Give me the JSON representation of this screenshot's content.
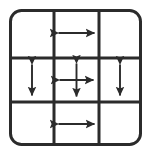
{
  "figure": {
    "type": "diagram",
    "background_color": "#ffffff",
    "stroke_color": "#2b2b2b",
    "outer_border": {
      "x": 9,
      "y": 9,
      "width": 133,
      "height": 137,
      "corner_radius": 11,
      "stroke_width": 3
    },
    "grid": {
      "rows": 3,
      "columns": 3,
      "vertical_lines_x": [
        54,
        99
      ],
      "horizontal_lines_y": [
        58,
        102
      ],
      "stroke_width": 3
    },
    "cells": [
      {
        "id": "cell-top-left",
        "row": 0,
        "column": 0,
        "arrow": "none",
        "label": ""
      },
      {
        "id": "cell-top-center",
        "row": 0,
        "column": 1,
        "arrow": "horizontal-double-arrow",
        "label": ""
      },
      {
        "id": "cell-top-right",
        "row": 0,
        "column": 2,
        "arrow": "none",
        "label": ""
      },
      {
        "id": "cell-middle-left",
        "row": 1,
        "column": 0,
        "arrow": "vertical-double-arrow",
        "label": ""
      },
      {
        "id": "cell-middle-center",
        "row": 1,
        "column": 1,
        "arrow": "four-way-double-arrow",
        "label": ""
      },
      {
        "id": "cell-middle-right",
        "row": 1,
        "column": 2,
        "arrow": "vertical-double-arrow",
        "label": ""
      },
      {
        "id": "cell-bottom-left",
        "row": 2,
        "column": 0,
        "arrow": "none",
        "label": ""
      },
      {
        "id": "cell-bottom-center",
        "row": 2,
        "column": 1,
        "arrow": "horizontal-double-arrow",
        "label": ""
      },
      {
        "id": "cell-bottom-right",
        "row": 2,
        "column": 2,
        "arrow": "none",
        "label": ""
      }
    ],
    "arrows": {
      "top_center": {
        "kind": "horizontal-double-arrow",
        "center_x": 76.5,
        "center_y": 33,
        "half_length": 20
      },
      "middle_left": {
        "kind": "vertical-double-arrow",
        "center_x": 32,
        "center_y": 80,
        "half_length": 17
      },
      "middle_center": {
        "kind": "four-way-double-arrow",
        "center_x": 76.5,
        "center_y": 80,
        "half_length_x": 19,
        "half_length_y": 18
      },
      "middle_right": {
        "kind": "vertical-double-arrow",
        "center_x": 120,
        "center_y": 80,
        "half_length": 17
      },
      "bottom_center": {
        "kind": "horizontal-double-arrow",
        "center_x": 76.5,
        "center_y": 124,
        "half_length": 20
      }
    }
  }
}
